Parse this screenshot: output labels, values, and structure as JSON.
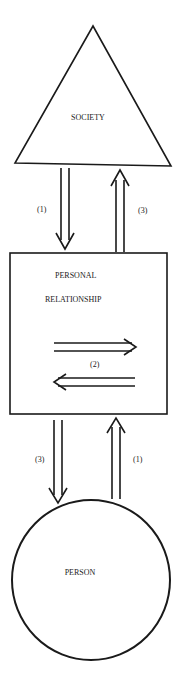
{
  "diagram": {
    "nodes": {
      "society": {
        "label": "SOCIETY",
        "shape": "triangle"
      },
      "relationship": {
        "label_line1": "PERSONAL",
        "label_line2": "RELATIONSHIP",
        "shape": "square"
      },
      "person": {
        "label": "PERSON",
        "shape": "circle"
      }
    },
    "arrows": {
      "society_to_relationship": {
        "label": "(1)",
        "direction": "down"
      },
      "relationship_to_society": {
        "label": "(3)",
        "direction": "up"
      },
      "internal": {
        "label": "(2)",
        "direction": "bidirectional"
      },
      "relationship_to_person": {
        "label": "(3)",
        "direction": "down"
      },
      "person_to_relationship": {
        "label": "(1)",
        "direction": "up"
      }
    },
    "colors": {
      "stroke": "#1a1a1a",
      "background": "#ffffff"
    }
  }
}
